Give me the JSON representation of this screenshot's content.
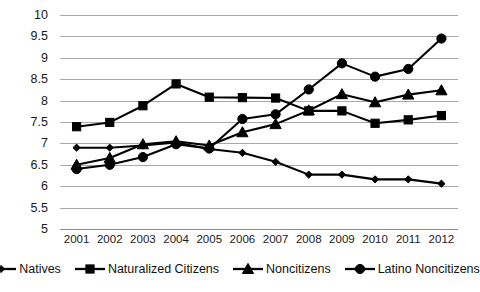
{
  "chart_data": {
    "type": "line",
    "title": "",
    "xlabel": "",
    "ylabel": "",
    "x": [
      2001,
      2002,
      2003,
      2004,
      2005,
      2006,
      2007,
      2008,
      2009,
      2010,
      2011,
      2012
    ],
    "xtick_labels": [
      "2001",
      "2002",
      "2003",
      "2004",
      "2005",
      "2006",
      "2007",
      "2008",
      "2009",
      "2010",
      "2011",
      "2012"
    ],
    "ylim": [
      5,
      10
    ],
    "ytick_labels": [
      "10",
      "9.5",
      "9",
      "8.5",
      "8",
      "7.5",
      "7",
      "6.5",
      "6",
      "5.5",
      "5"
    ],
    "yticks": [
      10,
      9.5,
      9,
      8.5,
      8,
      7.5,
      7,
      6.5,
      6,
      5.5,
      5
    ],
    "grid": "horizontal",
    "legend_position": "bottom",
    "series": [
      {
        "name": "Natives",
        "marker": "diamond",
        "color": "#000000",
        "values": [
          6.9,
          6.9,
          6.95,
          7.02,
          6.87,
          6.78,
          6.57,
          6.27,
          6.27,
          6.16,
          6.16,
          6.06
        ]
      },
      {
        "name": "Naturalized Citizens",
        "marker": "square",
        "color": "#000000",
        "values": [
          7.39,
          7.49,
          7.88,
          8.39,
          8.08,
          8.07,
          8.06,
          7.76,
          7.76,
          7.47,
          7.55,
          7.65
        ]
      },
      {
        "name": "Noncitizens",
        "marker": "triangle",
        "color": "#000000",
        "values": [
          6.5,
          6.66,
          6.98,
          7.05,
          6.95,
          7.26,
          7.45,
          7.77,
          8.15,
          7.96,
          8.14,
          8.24
        ]
      },
      {
        "name": "Latino Noncitizens",
        "marker": "circle",
        "color": "#000000",
        "values": [
          6.4,
          6.5,
          6.68,
          6.98,
          6.88,
          7.57,
          7.68,
          8.26,
          8.87,
          8.56,
          8.74,
          9.45
        ]
      }
    ]
  },
  "legend": {
    "items": [
      {
        "label": "Natives",
        "marker": "diamond"
      },
      {
        "label": "Naturalized Citizens",
        "marker": "square"
      },
      {
        "label": "Noncitizens",
        "marker": "triangle"
      },
      {
        "label": "Latino Noncitizens",
        "marker": "circle"
      }
    ]
  }
}
